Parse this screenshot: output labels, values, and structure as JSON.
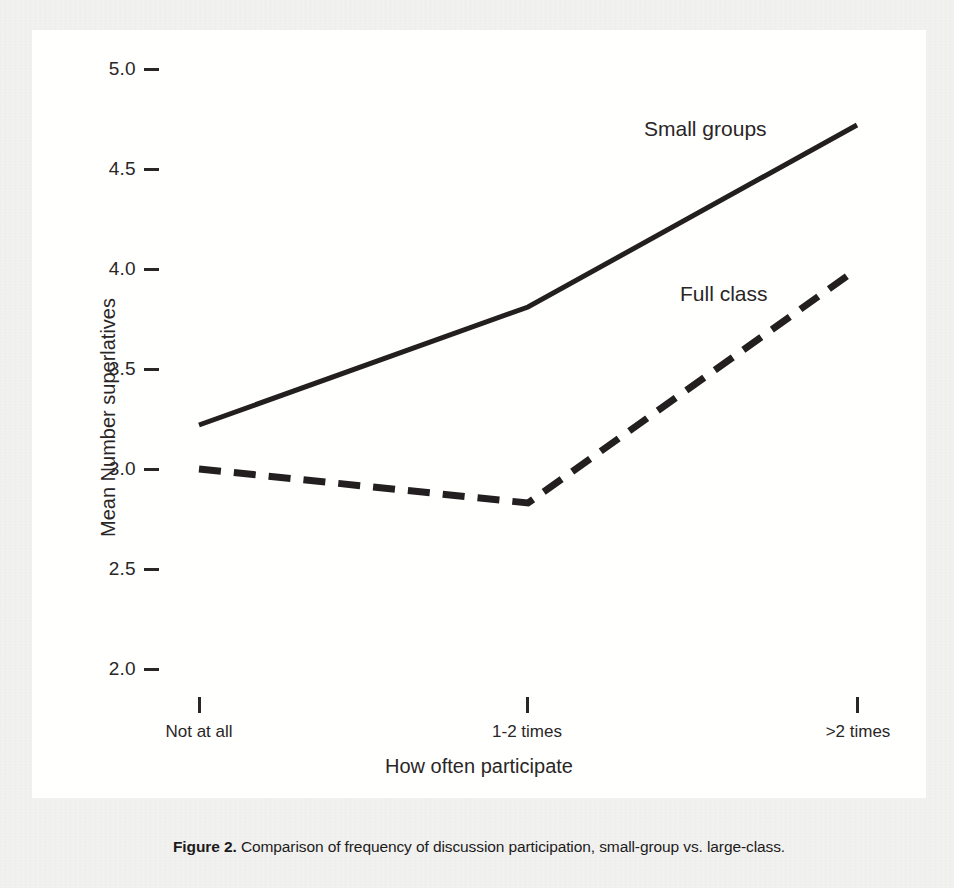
{
  "caption": {
    "label": "Figure 2.",
    "text": " Comparison of frequency of discussion participation, small-group vs. large-class."
  },
  "chart_data": {
    "type": "line",
    "title": "",
    "xlabel": "How often participate",
    "ylabel": "Mean Number superlatives",
    "categories": [
      "Not at all",
      "1-2 times",
      ">2 times"
    ],
    "ylim": [
      2.0,
      5.0
    ],
    "yticks": [
      "2.0",
      "2.5",
      "3.0",
      "3.5",
      "4.0",
      "4.5",
      "5.0"
    ],
    "ytick_values": [
      2.0,
      2.5,
      3.0,
      3.5,
      4.0,
      4.5,
      5.0
    ],
    "grid": false,
    "legend_position": "inline-annotation",
    "series": [
      {
        "name": "Small groups",
        "values": [
          3.22,
          3.81,
          4.72
        ],
        "style": "solid",
        "color": "#231f20"
      },
      {
        "name": "Full class",
        "values": [
          3.0,
          2.83,
          4.0
        ],
        "style": "dashed",
        "color": "#231f20"
      }
    ],
    "annotations": [
      {
        "text": "Small groups",
        "series": "Small groups"
      },
      {
        "text": "Full class",
        "series": "Full class"
      }
    ]
  }
}
